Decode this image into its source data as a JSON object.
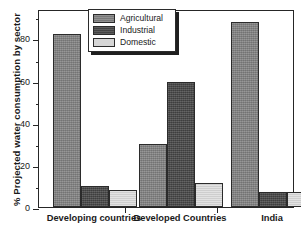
{
  "chart_data": {
    "type": "bar",
    "title": "",
    "xlabel": "",
    "ylabel": "% Projected  water consumption by sector",
    "categories": [
      "Developing countries",
      "Developed  Countries",
      "India"
    ],
    "series": [
      {
        "name": "Agricultural",
        "color": "#828282",
        "values": [
          82,
          30,
          88
        ]
      },
      {
        "name": "Industrial",
        "color": "#4a4a4a",
        "values": [
          10,
          59.5,
          7
        ]
      },
      {
        "name": "Domestic",
        "color": "#d6d6d6",
        "values": [
          8,
          11.5,
          7
        ]
      }
    ],
    "ylim": [
      0,
      94
    ],
    "yticks": [
      0,
      20,
      40,
      60,
      80
    ],
    "ytick_labels": [
      "0",
      "20",
      "40",
      "60",
      "80"
    ],
    "yminor_ticks": [
      10,
      30,
      50,
      70,
      90
    ],
    "grid": false,
    "legend_position": "top-center"
  },
  "axis": {
    "y_title": "% Projected  water consumption by sector"
  },
  "legend": {
    "items": [
      {
        "label": "Agricultural"
      },
      {
        "label": "Industrial"
      },
      {
        "label": "Domestic"
      }
    ]
  }
}
